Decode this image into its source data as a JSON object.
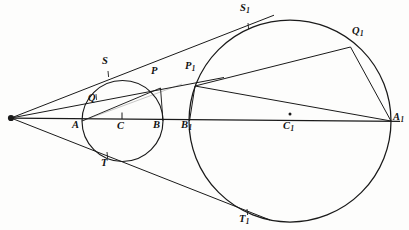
{
  "figure": {
    "background_color": "#fdfdfc",
    "stroke_color": "#1a1a1a",
    "label_color": "#121212"
  },
  "labels": [
    {
      "id": "apex",
      "text": "",
      "sub": "",
      "x": 11,
      "y": 118,
      "lx": 0,
      "ly": 0
    },
    {
      "id": "A",
      "text": "A",
      "sub": "",
      "x": 82,
      "y": 121,
      "lx": 72,
      "ly": 126
    },
    {
      "id": "B",
      "text": "B",
      "sub": "",
      "x": 163,
      "y": 121,
      "lx": 154,
      "ly": 126
    },
    {
      "id": "C",
      "text": "C",
      "sub": "",
      "x": 122,
      "y": 121,
      "lx": 117,
      "ly": 126
    },
    {
      "id": "S",
      "text": "S",
      "sub": "",
      "x": 108,
      "y": 74,
      "lx": 102,
      "ly": 60
    },
    {
      "id": "T",
      "text": "T",
      "sub": "",
      "x": 107,
      "y": 155,
      "lx": 101,
      "ly": 161
    },
    {
      "id": "P",
      "text": "P",
      "sub": "",
      "x": 160,
      "y": 88,
      "lx": 152,
      "ly": 70
    },
    {
      "id": "Q",
      "text": "Q",
      "sub": "",
      "x": 96,
      "y": 97,
      "lx": 89,
      "ly": 96
    },
    {
      "id": "A1",
      "text": "A",
      "sub": "1",
      "x": 391,
      "y": 121,
      "lx": 393,
      "ly": 116
    },
    {
      "id": "B1",
      "text": "B",
      "sub": "1",
      "x": 189,
      "y": 121,
      "lx": 182,
      "ly": 126
    },
    {
      "id": "C1",
      "text": "C",
      "sub": "1",
      "x": 290,
      "y": 121,
      "lx": 284,
      "ly": 126
    },
    {
      "id": "S1",
      "text": "S",
      "sub": "1",
      "x": 248,
      "y": 26,
      "lx": 241,
      "ly": 5
    },
    {
      "id": "T1",
      "text": "T",
      "sub": "1",
      "x": 247,
      "y": 212,
      "lx": 240,
      "ly": 216
    },
    {
      "id": "P1",
      "text": "P",
      "sub": "1",
      "x": 195,
      "y": 86,
      "lx": 186,
      "ly": 65
    },
    {
      "id": "Q1",
      "text": "Q",
      "sub": "1",
      "x": 350,
      "y": 47,
      "lx": 353,
      "ly": 30
    }
  ],
  "shapes": {
    "small_circle": {
      "cx": 122.5,
      "cy": 121,
      "r": 40.5,
      "label": "circle-C"
    },
    "large_circle": {
      "cx": 290,
      "cy": 121,
      "r": 101,
      "label": "circle-C1"
    },
    "axis": {
      "x1": 11,
      "y1": 118,
      "x2": 400,
      "y2": 121,
      "label": "central-axis"
    },
    "center_tick_c": {
      "x": 122,
      "y_top": 112,
      "y_bottom": 119
    },
    "center_dot_c1": {
      "cx": 290,
      "cy": 114,
      "r": 1.4
    }
  },
  "lines": [
    {
      "id": "tangent-upper",
      "from": "apex",
      "to": "S1",
      "x1": 11,
      "y1": 118,
      "x2": 272,
      "y2": 16,
      "note": "upper common tangent through S and S1"
    },
    {
      "id": "tangent-lower",
      "from": "apex",
      "to": "T1",
      "x1": 11,
      "y1": 118,
      "x2": 268,
      "y2": 219,
      "note": "lower common tangent through T and T1"
    },
    {
      "id": "secant-apex-P1",
      "from": "apex",
      "to": "P1",
      "x1": 11,
      "y1": 118,
      "x2": 222,
      "y2": 78,
      "note": "secant through Q, P and P1"
    },
    {
      "id": "chord-A-P",
      "from": "A",
      "to": "P",
      "x1": 82,
      "y1": 121,
      "x2": 160,
      "y2": 88,
      "note": "chord of small circle"
    },
    {
      "id": "chord-P-B",
      "from": "P",
      "to": "B",
      "x1": 160,
      "y1": 88,
      "x2": 163,
      "y2": 121,
      "note": "chord of small circle"
    },
    {
      "id": "chord-B1-P1",
      "from": "B1",
      "to": "P1",
      "x1": 189,
      "y1": 121,
      "x2": 195,
      "y2": 86,
      "note": "chord of large circle"
    },
    {
      "id": "chord-P1-A1",
      "from": "P1",
      "to": "A1",
      "x1": 195,
      "y1": 86,
      "x2": 391,
      "y2": 121,
      "note": "chord of large circle"
    },
    {
      "id": "chord-P1-Q1",
      "from": "P1",
      "to": "Q1",
      "x1": 195,
      "y1": 86,
      "x2": 350,
      "y2": 47,
      "note": "chord of large circle"
    },
    {
      "id": "chord-Q1-A1",
      "from": "Q1",
      "to": "A1",
      "x1": 350,
      "y1": 47,
      "x2": 391,
      "y2": 121,
      "note": "chord of large circle"
    }
  ]
}
